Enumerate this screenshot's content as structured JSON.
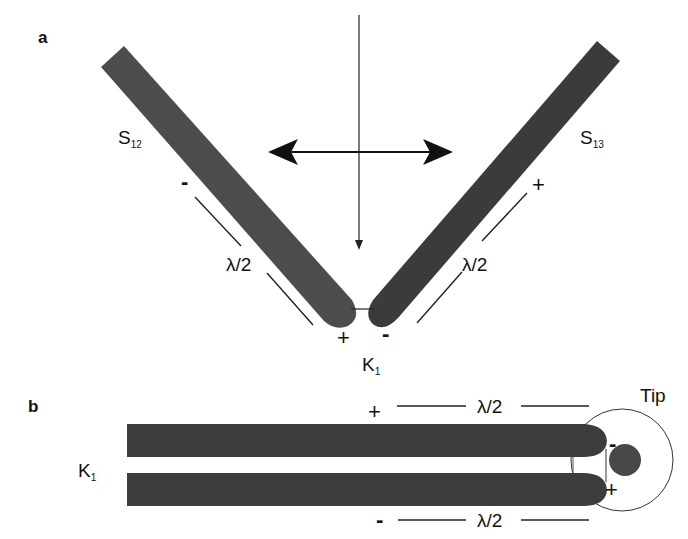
{
  "figure": {
    "colors": {
      "rod": "#4a4a4a",
      "rod_dark": "#383838",
      "line": "#222222",
      "background": "#ffffff"
    },
    "panel_a": {
      "label": "a",
      "left_rod": {
        "name": "S",
        "subscript": "12"
      },
      "right_rod": {
        "name": "S",
        "subscript": "13"
      },
      "gap_label": {
        "name": "K",
        "subscript": "1"
      },
      "left_length_label": "λ/2",
      "right_length_label": "λ/2",
      "left_top_sign": "-",
      "left_bottom_sign": "+",
      "right_top_sign": "+",
      "right_bottom_sign": "-",
      "incident_arrow": "vertical-incident-beam",
      "polarization_arrow": "horizontal-double-arrow"
    },
    "panel_b": {
      "label": "b",
      "gap_label": {
        "name": "K",
        "subscript": "1"
      },
      "top_length_label": "λ/2",
      "bottom_length_label": "λ/2",
      "top_left_sign": "+",
      "bottom_left_sign": "-",
      "tip_label": "Tip",
      "tip_top_sign": "-",
      "tip_bottom_sign": "+"
    }
  }
}
